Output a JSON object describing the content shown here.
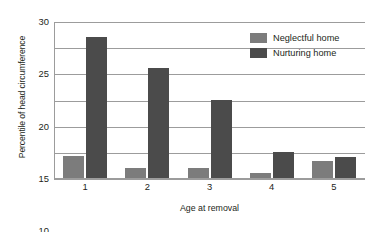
{
  "chart_data": {
    "type": "bar",
    "title": "",
    "xlabel": "Age at removal",
    "ylabel": "Percentile of head circumference",
    "categories": [
      "1",
      "2",
      "3",
      "4",
      "5"
    ],
    "series": [
      {
        "name": "Neglectful home",
        "color": "#7c7c7c",
        "values": [
          4.3,
          2.0,
          2.0,
          1.0,
          3.2
        ]
      },
      {
        "name": "Nurturing home",
        "color": "#4b4b4b",
        "values": [
          27.0,
          21.0,
          15.0,
          5.0,
          4.0
        ]
      }
    ],
    "ylim": [
      0,
      30
    ],
    "yticks": [
      "0",
      "5",
      "10",
      "15",
      "20",
      "25",
      "30"
    ],
    "grid": true,
    "legend_position": "top-right"
  },
  "axis": {
    "y_title": "Percentile of head circumference",
    "x_title": "Age at removal"
  }
}
